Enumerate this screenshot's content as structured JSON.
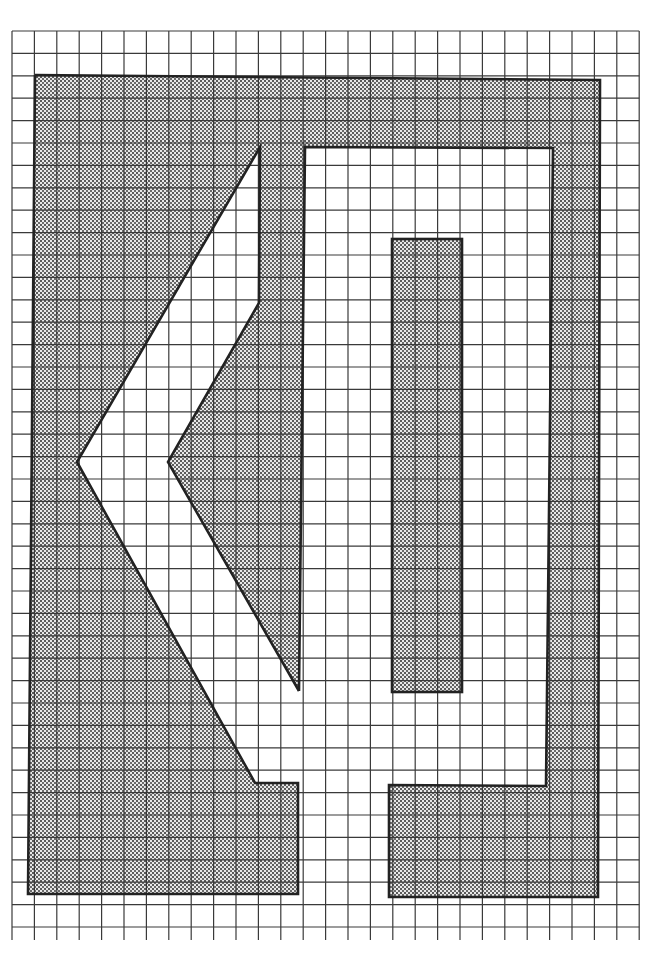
{
  "figure": {
    "colors": {
      "background": "#ffffff",
      "grid_line": "#3a3a3a",
      "outline": "#222222",
      "halftone_dot": "#555555",
      "halftone_bg": "#e6e6e6"
    },
    "grid": {
      "x0": 12,
      "y0": 31,
      "cell": 22.4,
      "cols": 28,
      "rows": 41
    },
    "shapes": {
      "outer_frame": "Shaded region bounded by left block, top band, right column and bottom-right block",
      "chevron": "White left-pointing arrow cut-out with tip on left",
      "inner_bar": "Shaded vertical rectangle inside white channel"
    }
  }
}
